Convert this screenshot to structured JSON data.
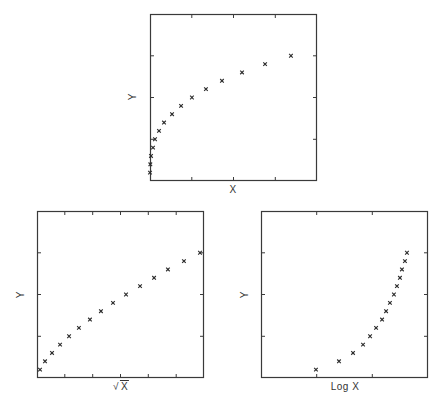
{
  "chart_data": [
    {
      "type": "scatter",
      "panel": "top",
      "title": "",
      "xlabel": "X",
      "ylabel": "Y",
      "marker": "x",
      "xlim": [
        0,
        100
      ],
      "ylim": [
        0,
        20
      ],
      "x_ticks": 4,
      "y_ticks": 4,
      "grid": false,
      "x": [
        0,
        0.2,
        0.6,
        1.8,
        3.0,
        5.4,
        8.4,
        13.2,
        18.6,
        25.1,
        33.5,
        43.1,
        55.1,
        68.9,
        84.4
      ],
      "y": [
        1,
        2,
        3,
        4,
        5,
        6,
        7,
        8,
        9,
        10,
        11,
        12,
        13,
        14,
        15
      ],
      "px": {
        "left": 150,
        "top": 14,
        "size": 167
      }
    },
    {
      "type": "scatter",
      "panel": "bottom-left",
      "title": "",
      "xlabel": "√X",
      "ylabel": "Y",
      "marker": "x",
      "xlim": [
        0,
        100
      ],
      "ylim": [
        0,
        20
      ],
      "x_ticks": 6,
      "y_ticks": 4,
      "grid": false,
      "x": [
        1.8,
        4.8,
        9.0,
        13.8,
        19.2,
        25.1,
        31.7,
        38.3,
        45.5,
        53.3,
        61.7,
        70.1,
        78.4,
        88.0,
        97.6
      ],
      "y": [
        1,
        2,
        3,
        4,
        5,
        6,
        7,
        8,
        9,
        10,
        11,
        12,
        13,
        14,
        15
      ],
      "px": {
        "left": 37,
        "top": 211,
        "size": 167
      }
    },
    {
      "type": "scatter",
      "panel": "bottom-right",
      "title": "",
      "xlabel": "Log X",
      "ylabel": "Y",
      "marker": "x",
      "xlim": [
        0,
        100
      ],
      "ylim": [
        0,
        20
      ],
      "x_ticks": 3,
      "y_ticks": 4,
      "grid": false,
      "x": [
        32.9,
        46.7,
        55.1,
        61.1,
        65.3,
        68.9,
        72.5,
        74.9,
        77.2,
        79.6,
        81.4,
        83.2,
        84.4,
        86.2,
        87.4
      ],
      "y": [
        1,
        2,
        3,
        4,
        5,
        6,
        7,
        8,
        9,
        10,
        11,
        12,
        13,
        14,
        15
      ],
      "px": {
        "left": 261,
        "top": 211,
        "size": 167
      }
    }
  ],
  "labels": {
    "top": {
      "x": "X",
      "y": "Y"
    },
    "bottom_left": {
      "x_radical": "√",
      "x_under": "X",
      "y": "Y"
    },
    "bottom_right": {
      "x": "Log X",
      "y": "Y"
    }
  },
  "colors": {
    "axis": "#3a3a3a",
    "marker": "#2a2a2a",
    "background": "#ffffff"
  }
}
